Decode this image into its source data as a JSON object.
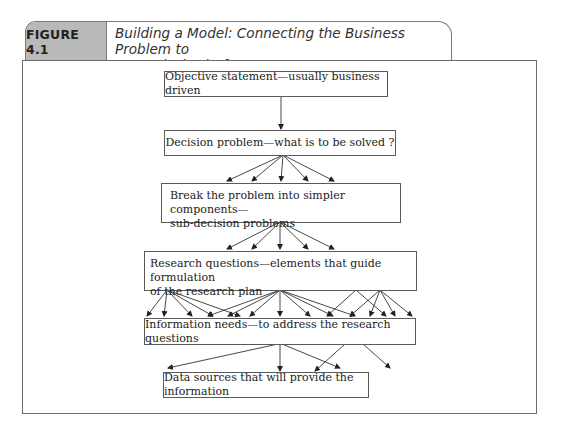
{
  "figure": {
    "label": "FIGURE 4.1",
    "title": "Building a Model: Connecting the Business Problem to an Analysis Platform",
    "title_line1": "Building a Model: Connecting the Business Problem to",
    "title_line2": "an Analysis Platform"
  },
  "nodes": [
    {
      "id": "objective",
      "text": "Objective statement—usually business driven"
    },
    {
      "id": "decision",
      "text": "Decision problem—what is to be solved ?"
    },
    {
      "id": "breakdown",
      "text_line1": "Break the problem into simpler components—",
      "text_line2": "sub-decision problems"
    },
    {
      "id": "research",
      "text_line1": "Research questions—elements that guide formulation",
      "text_line2": "of the research plan"
    },
    {
      "id": "info",
      "text": "Information needs—to address the research questions"
    },
    {
      "id": "data",
      "text": "Data sources that will provide the information"
    }
  ],
  "edges_summary": {
    "objective_to_decision": 1,
    "decision_to_breakdown": 5,
    "breakdown_to_research": 5,
    "research_to_info": 18,
    "info_to_data": 5
  },
  "colors": {
    "label_bg": "#b9b9b9",
    "border": "#6e6e6e",
    "text": "#222222"
  }
}
